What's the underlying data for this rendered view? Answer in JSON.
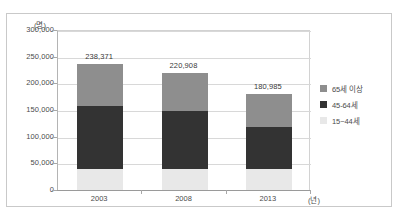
{
  "figure": {
    "crop_remnant_text": "",
    "unit_y": "(명)",
    "unit_x": "(년)"
  },
  "chart_data": {
    "type": "bar",
    "subtype": "stacked-bar",
    "title": "",
    "xlabel": "(년)",
    "ylabel": "(명)",
    "ylim": [
      0,
      300000
    ],
    "ytick_step": 50000,
    "grid": true,
    "legend_position": "right",
    "categories": [
      "2003",
      "2008",
      "2013"
    ],
    "ytick_labels": [
      "300,000",
      "250,000",
      "200,000",
      "150,000",
      "100,000",
      "50,000",
      "0"
    ],
    "ytick_values": [
      300000,
      250000,
      200000,
      150000,
      100000,
      50000,
      0
    ],
    "series": [
      {
        "name": "65세 이상",
        "color": "#8e8e8e",
        "values": [
          78371,
          70908,
          60985
        ]
      },
      {
        "name": "45-64세",
        "color": "#333333",
        "values": [
          118000,
          108000,
          78000
        ]
      },
      {
        "name": "15~44세",
        "color": "#e8e8e8",
        "values": [
          42000,
          42000,
          42000
        ]
      }
    ],
    "totals": [
      238371,
      220908,
      180985
    ],
    "total_labels": [
      "238,371",
      "220,908",
      "180,985"
    ]
  },
  "legend": {
    "items": [
      {
        "label": "65세 이상",
        "color": "#8e8e8e"
      },
      {
        "label": "45-64세",
        "color": "#333333"
      },
      {
        "label": "15~44세",
        "color": "#e8e8e8"
      }
    ]
  }
}
